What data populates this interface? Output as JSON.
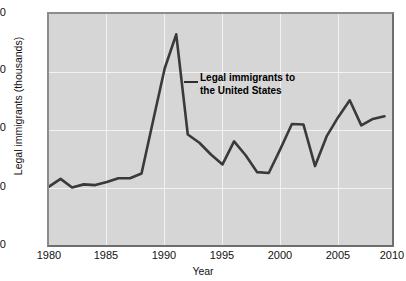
{
  "chart_data": {
    "type": "line",
    "title": "",
    "xlabel": "Year",
    "ylabel": "Legal immigrants (thousands)",
    "xlim": [
      1980,
      2010
    ],
    "ylim": [
      0,
      2000
    ],
    "xticks": [
      1980,
      1985,
      1990,
      1995,
      2000,
      2005,
      2010
    ],
    "yticks": [
      0,
      500,
      1000,
      1500,
      2000
    ],
    "grid": true,
    "legend": "none",
    "annotations": [
      {
        "text": "Legal immigrants to the United States",
        "line1": "Legal immigrants to",
        "line2": "the United States",
        "points_to_year": 1991
      }
    ],
    "series": [
      {
        "name": "Legal immigrants to the United States",
        "color": "#3a3a3a",
        "x": [
          1980,
          1981,
          1982,
          1983,
          1984,
          1985,
          1986,
          1987,
          1988,
          1989,
          1990,
          1991,
          1992,
          1993,
          1994,
          1995,
          1996,
          1997,
          1998,
          1999,
          2000,
          2001,
          2002,
          2003,
          2004,
          2005,
          2006,
          2007,
          2008,
          2009
        ],
        "values": [
          531,
          597,
          524,
          550,
          544,
          570,
          602,
          602,
          643,
          1091,
          1536,
          1827,
          974,
          904,
          804,
          720,
          916,
          798,
          654,
          647,
          850,
          1064,
          1059,
          706,
          958,
          1122,
          1266,
          1052,
          1107,
          1130
        ]
      }
    ]
  },
  "axes": {
    "y_tick_labels": [
      "2000",
      "1500",
      "1000",
      "500",
      "0"
    ],
    "x_tick_labels": [
      "1980",
      "1985",
      "1990",
      "1995",
      "2000",
      "2005",
      "2010"
    ],
    "y_axis_title": "Legal immigrants (thousands)",
    "x_axis_title": "Year"
  },
  "style": {
    "plot_background": "#d6d6d6",
    "gridline_color": "#f2f2f2",
    "line_color": "#3a3a3a",
    "text_color": "#111111"
  }
}
